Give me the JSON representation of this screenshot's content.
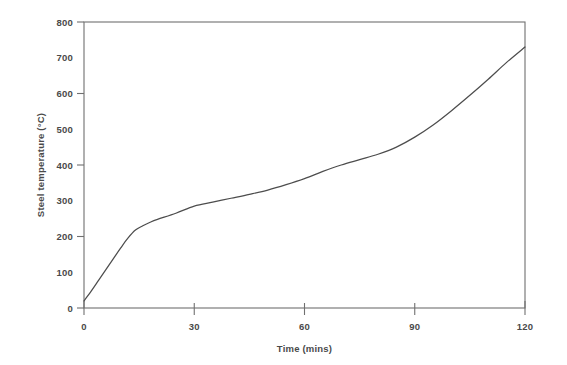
{
  "chart_data": {
    "type": "line",
    "title": "",
    "xlabel": "Time (mins)",
    "ylabel": "Steel temperature (°C)",
    "xlim": [
      0,
      120
    ],
    "ylim": [
      0,
      800
    ],
    "grid": false,
    "legend": false,
    "x_ticks": [
      0,
      30,
      60,
      90,
      120
    ],
    "x_tick_labels": [
      "0",
      "30",
      "60",
      "90",
      "120"
    ],
    "y_ticks": [
      0,
      200,
      400,
      600,
      800
    ],
    "y_tick_labels": [
      "0",
      "100",
      "200",
      "300",
      "400",
      "500",
      "600",
      "700",
      "800"
    ],
    "y_label_values": [
      0,
      100,
      200,
      300,
      400,
      500,
      600,
      700,
      800
    ],
    "series": [
      {
        "name": "Steel temperature",
        "color": "#4d4d4d",
        "x": [
          0,
          2,
          4,
          6,
          8,
          10,
          12,
          14,
          16,
          18,
          20,
          25,
          30,
          35,
          40,
          45,
          50,
          55,
          60,
          65,
          70,
          75,
          80,
          85,
          90,
          95,
          100,
          105,
          110,
          115,
          120
        ],
        "y": [
          20,
          48,
          78,
          108,
          138,
          168,
          196,
          218,
          230,
          240,
          248,
          265,
          285,
          296,
          307,
          318,
          330,
          345,
          362,
          382,
          400,
          415,
          430,
          450,
          478,
          512,
          552,
          595,
          640,
          687,
          730
        ]
      }
    ]
  },
  "axes": {
    "y_axis_title": "Steel temperature (°C)",
    "x_axis_title": "Time (mins)"
  }
}
